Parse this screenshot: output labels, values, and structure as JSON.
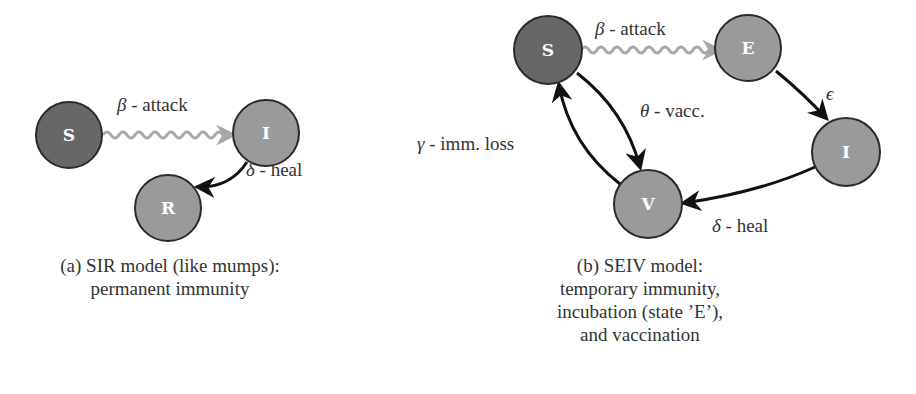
{
  "colors": {
    "dark_node": "#676767",
    "light_node": "#9a9a9a",
    "node_stroke": "#2a2a2a",
    "wavy_edge": "#a8a8a8",
    "solid_edge": "#111111"
  },
  "sir": {
    "nodes": {
      "S": "S",
      "I": "I",
      "R": "R"
    },
    "edges": {
      "attack": {
        "symbol": "β",
        "text": " - attack"
      },
      "heal": {
        "symbol": "δ",
        "text": " - heal"
      }
    },
    "caption": [
      "(a) SIR model (like mumps):",
      "permanent immunity"
    ]
  },
  "seiv": {
    "nodes": {
      "S": "S",
      "E": "E",
      "I": "I",
      "V": "V"
    },
    "edges": {
      "attack": {
        "symbol": "β",
        "text": " - attack"
      },
      "incubation": {
        "symbol": "ϵ",
        "text": ""
      },
      "heal": {
        "symbol": "δ",
        "text": " - heal"
      },
      "vacc": {
        "symbol": "θ",
        "text": " - vacc."
      },
      "imm_loss": {
        "symbol": "γ",
        "text": " - imm. loss"
      }
    },
    "caption": [
      "(b) SEIV model:",
      "temporary immunity,",
      "incubation (state ’E’),",
      "and vaccination"
    ]
  }
}
